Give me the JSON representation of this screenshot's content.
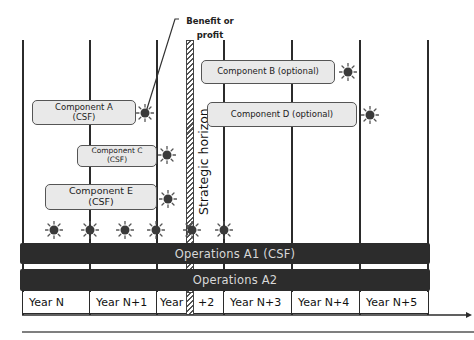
{
  "diagram": {
    "callout": {
      "line1": "Benefit or",
      "line2": "profit"
    },
    "strategic_horizon_label": "Strategic horizon",
    "components": [
      {
        "id": "A",
        "line1": "Component  A",
        "line2": "(CSF)"
      },
      {
        "id": "B",
        "line1": "Component  B (optional)"
      },
      {
        "id": "C",
        "line1": "Component  C",
        "line2": "(CSF)"
      },
      {
        "id": "D",
        "line1": "Component  D (optional)"
      },
      {
        "id": "E",
        "line1": "Component  E",
        "line2": "(CSF)"
      }
    ],
    "operations": [
      {
        "label": "Operations  A1 (CSF)"
      },
      {
        "label": "Operations  A2"
      }
    ],
    "years": [
      "Year N",
      "Year N+1",
      "Year",
      "+2",
      "Year N+3",
      "Year N+4",
      "Year N+5"
    ],
    "icons": {
      "benefit": "sun-icon"
    },
    "colors": {
      "bar": "#2c2c2c",
      "component_fill": "#e9e9e9",
      "line": "#2b2b2b"
    }
  }
}
